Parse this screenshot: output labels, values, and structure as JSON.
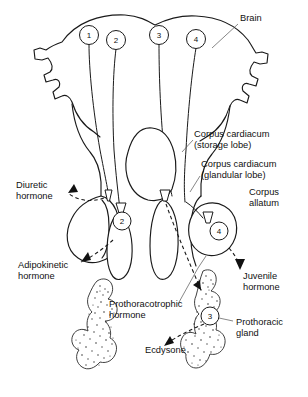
{
  "figure": {
    "background_color": "#ffffff",
    "line_color": "#1a1a1a",
    "text_color": "#111111"
  },
  "numbered_markers": [
    {
      "id": "1",
      "label": "1",
      "x": 89,
      "y": 35
    },
    {
      "id": "2",
      "label": "2",
      "x": 116,
      "y": 40
    },
    {
      "id": "3",
      "label": "3",
      "x": 159,
      "y": 35
    },
    {
      "id": "4",
      "label": "4",
      "x": 196,
      "y": 39
    },
    {
      "id": "2b",
      "label": "2",
      "x": 122,
      "y": 221
    },
    {
      "id": "4b",
      "label": "4",
      "x": 219,
      "y": 231
    },
    {
      "id": "3b",
      "label": "3",
      "x": 210,
      "y": 316
    }
  ],
  "anatomy_labels": [
    {
      "name": "brain",
      "lines": [
        "Brain"
      ],
      "x": 240,
      "y": 21
    },
    {
      "name": "corpus-cardiacum-storage",
      "lines": [
        "Corpus cardiacum",
        "(storage lobe)"
      ],
      "x": 194,
      "y": 137
    },
    {
      "name": "corpus-cardiacum-glandular",
      "lines": [
        "Corpus cardiacum",
        "(glandular lobe)"
      ],
      "x": 201,
      "y": 167
    },
    {
      "name": "corpus-allatum",
      "lines": [
        "Corpus",
        "allatum"
      ],
      "x": 249,
      "y": 195
    },
    {
      "name": "prothoracic-gland",
      "lines": [
        "Prothoracic",
        "gland"
      ],
      "x": 236,
      "y": 325
    }
  ],
  "hormone_labels": [
    {
      "name": "diuretic-hormone",
      "lines": [
        "Diuretic",
        "hormone"
      ],
      "x": 16,
      "y": 188
    },
    {
      "name": "adipokinetic-hormone",
      "lines": [
        "Adipokinetic",
        "hormone"
      ],
      "x": 18,
      "y": 268
    },
    {
      "name": "prothoracotrophic-hormone",
      "lines": [
        "Prothoracotrophic",
        "hormone"
      ],
      "x": 109,
      "y": 307
    },
    {
      "name": "juvenile-hormone",
      "lines": [
        "Juvenile",
        "hormone"
      ],
      "x": 243,
      "y": 279
    },
    {
      "name": "ecdysone",
      "lines": [
        "Ecdysone"
      ],
      "x": 145,
      "y": 353
    }
  ]
}
